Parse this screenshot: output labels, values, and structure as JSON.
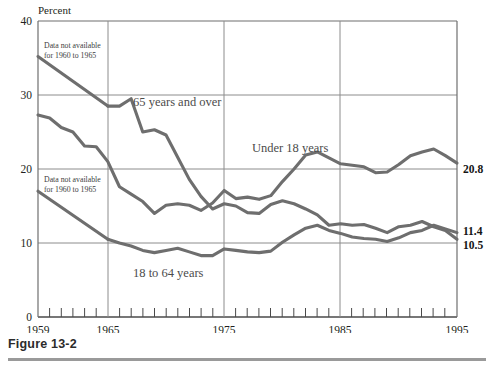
{
  "figure": {
    "caption": "Figure 13-2",
    "ylabel": "Percent"
  },
  "annotations": {
    "note_top": "Data not available\nfor 1960 to 1965",
    "note_top_line1": "Data not available",
    "note_top_line2": "for 1960 to 1965",
    "note_bottom_line1": "Data not available",
    "note_bottom_line2": "for 1960 to 1965"
  },
  "series_labels": {
    "over65": "65 years and over",
    "under18": "Under 18 years",
    "adults": "18 to 64 years"
  },
  "end_labels": {
    "under18": "20.8",
    "adults": "11.4",
    "over65": "10.5"
  },
  "axis": {
    "y_ticks": [
      "40",
      "30",
      "20",
      "10",
      "0"
    ],
    "x_ticks": [
      "1959",
      "1965",
      "1975",
      "1985",
      "1995"
    ]
  },
  "colors": {
    "line": "#6e6e6e",
    "grid": "#8c8c8c",
    "frame": "#6f6f6f",
    "caption_rule": "#9a9a9a",
    "text": "#231f20"
  },
  "chart_data": {
    "type": "line",
    "xlabel": "",
    "ylabel": "Percent",
    "xlim": [
      1959,
      1995
    ],
    "ylim": [
      0,
      40
    ],
    "grid": true,
    "legend": "inline-labels",
    "x": [
      1959,
      1960,
      1961,
      1962,
      1963,
      1964,
      1965,
      1966,
      1967,
      1968,
      1969,
      1970,
      1971,
      1972,
      1973,
      1974,
      1975,
      1976,
      1977,
      1978,
      1979,
      1980,
      1981,
      1982,
      1983,
      1984,
      1985,
      1986,
      1987,
      1988,
      1989,
      1990,
      1991,
      1992,
      1993,
      1994,
      1995
    ],
    "series": [
      {
        "name": "65 years and over",
        "note": "Data not available for 1960 to 1965",
        "values": [
          35.2,
          null,
          null,
          null,
          null,
          null,
          28.5,
          28.5,
          29.5,
          25.0,
          25.3,
          24.6,
          21.6,
          18.6,
          16.3,
          14.6,
          15.3,
          15.0,
          14.1,
          14.0,
          15.2,
          15.7,
          15.3,
          14.6,
          13.8,
          12.4,
          12.6,
          12.4,
          12.5,
          12.0,
          11.4,
          12.2,
          12.4,
          12.9,
          12.2,
          11.7,
          10.5
        ]
      },
      {
        "name": "Under 18 years",
        "values": [
          27.3,
          26.9,
          25.6,
          25.0,
          23.1,
          23.0,
          21.0,
          17.6,
          16.6,
          15.6,
          14.0,
          15.1,
          15.3,
          15.1,
          14.4,
          15.4,
          17.1,
          16.0,
          16.2,
          15.9,
          16.4,
          18.3,
          20.0,
          21.9,
          22.3,
          21.5,
          20.7,
          20.5,
          20.3,
          19.5,
          19.6,
          20.6,
          21.8,
          22.3,
          22.7,
          21.8,
          20.8
        ]
      },
      {
        "name": "18 to 64 years",
        "note": "Data not available for 1960 to 1965",
        "values": [
          17.0,
          null,
          null,
          null,
          null,
          null,
          10.5,
          10.0,
          9.6,
          9.0,
          8.7,
          9.0,
          9.3,
          8.8,
          8.3,
          8.3,
          9.2,
          9.0,
          8.8,
          8.7,
          8.9,
          10.1,
          11.1,
          12.0,
          12.4,
          11.7,
          11.3,
          10.8,
          10.6,
          10.5,
          10.2,
          10.7,
          11.4,
          11.7,
          12.4,
          11.9,
          11.4
        ]
      }
    ]
  }
}
